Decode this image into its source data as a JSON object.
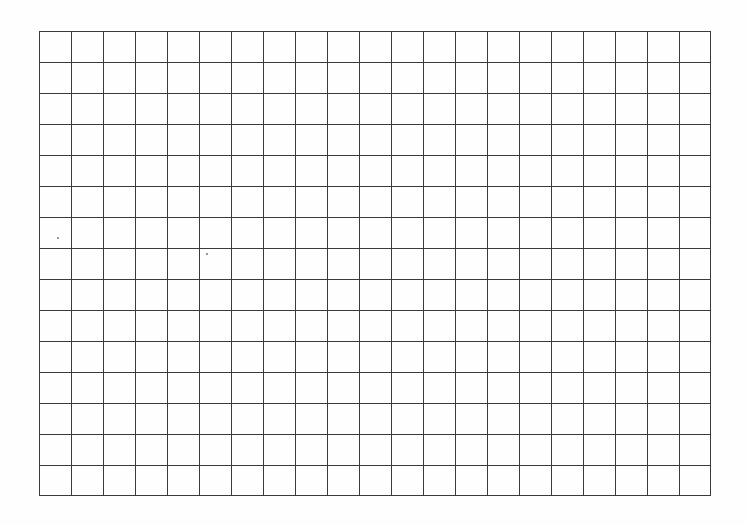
{
  "document": {
    "type": "blank-grid-sheet",
    "grid": {
      "columns": 21,
      "rows": 15,
      "left": 39,
      "top": 31,
      "cell_width": 32,
      "cell_height": 31,
      "line_color": "#3a3a3a",
      "background_color": "#fefefe"
    },
    "specks": [
      {
        "x": 57,
        "y": 237
      },
      {
        "x": 206,
        "y": 253
      }
    ]
  }
}
